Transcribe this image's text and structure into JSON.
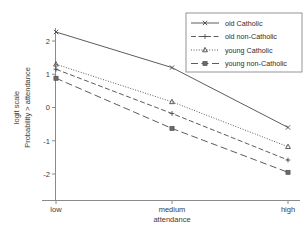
{
  "chart_data": {
    "type": "line",
    "title": "",
    "xlabel": "attendance",
    "ylabel": "Probability > attendance",
    "ylabel_outer": "logit scale",
    "categories": [
      "low",
      "medium",
      "high"
    ],
    "xtick_labels": [
      "low",
      "medium",
      "high"
    ],
    "ytick_labels": [
      "-2",
      "-1",
      "0",
      "1",
      "2"
    ],
    "yticks": [
      -2,
      -1,
      0,
      1,
      2
    ],
    "ylim": [
      -2.35,
      2.55
    ],
    "grid": false,
    "legend_position": "top-right",
    "series": [
      {
        "name": "old Catholic",
        "values": [
          2.27,
          1.2,
          -0.6
        ],
        "line_style": "solid",
        "marker": "cross"
      },
      {
        "name": "old non-Catholic",
        "values": [
          1.15,
          -0.18,
          -1.58
        ],
        "line_style": "dashed",
        "marker": "plus"
      },
      {
        "name": "young Catholic",
        "values": [
          1.3,
          0.17,
          -1.18
        ],
        "line_style": "dotted",
        "marker": "triangle"
      },
      {
        "name": "young non-Catholic",
        "values": [
          0.88,
          -0.63,
          -1.95
        ],
        "line_style": "longdash",
        "marker": "square"
      }
    ]
  },
  "legend": {
    "entries": [
      "old Catholic",
      "old non-Catholic",
      "young Catholic",
      "young non-Catholic"
    ]
  },
  "colors": {
    "axis": "#8a8a8a",
    "line": "#4a4a4a",
    "text": "#2e2e2e",
    "background": "#ffffff"
  }
}
